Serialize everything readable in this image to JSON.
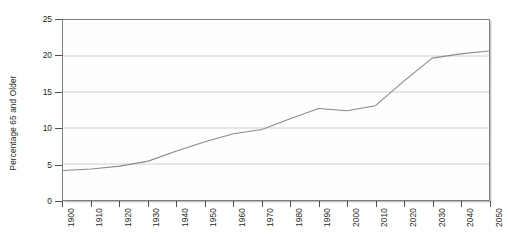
{
  "chart_data": {
    "type": "line",
    "title": "",
    "xlabel": "",
    "ylabel": "Percentage 65 and Older",
    "categories": [
      "1900",
      "1910",
      "1920",
      "1930",
      "1940",
      "1950",
      "1960",
      "1970",
      "1980",
      "1990",
      "2000",
      "2010",
      "2020",
      "2030",
      "2040",
      "2050"
    ],
    "x": [
      1900,
      1910,
      1920,
      1930,
      1940,
      1950,
      1960,
      1970,
      1980,
      1990,
      2000,
      2010,
      2020,
      2030,
      2040,
      2050
    ],
    "values": [
      4.1,
      4.3,
      4.7,
      5.4,
      6.8,
      8.1,
      9.2,
      9.8,
      11.3,
      12.7,
      12.4,
      13.1,
      16.5,
      19.7,
      20.3,
      20.7
    ],
    "ylim": [
      0,
      25
    ],
    "xlim": [
      1900,
      2050
    ],
    "yticks": [
      0,
      5,
      10,
      15,
      20,
      25
    ],
    "ytick_labels": [
      "0",
      "5",
      "10",
      "15",
      "20",
      "25"
    ],
    "xticks": [
      1900,
      1910,
      1920,
      1930,
      1940,
      1950,
      1960,
      1970,
      1980,
      1990,
      2000,
      2010,
      2020,
      2030,
      2040,
      2050
    ],
    "grid": "horizontal",
    "legend": "none",
    "line_color": "#8a8a8a",
    "axis_color": "#4d4d4d",
    "grid_color": "#c9c9c9",
    "background_color": "#ffffff",
    "plot_background_color": "#fefefe",
    "series": [
      {
        "name": "Percentage 65 and Older",
        "values": [
          4.1,
          4.3,
          4.7,
          5.4,
          6.8,
          8.1,
          9.2,
          9.8,
          11.3,
          12.7,
          12.4,
          13.1,
          16.5,
          19.7,
          20.3,
          20.7
        ]
      }
    ]
  }
}
